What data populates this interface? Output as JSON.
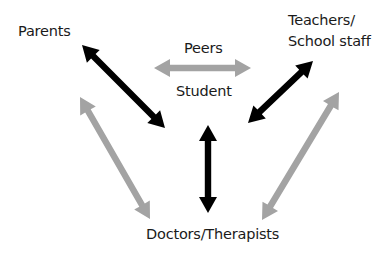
{
  "diagram": {
    "nodes": {
      "parents": "Parents",
      "peers": "Peers",
      "student": "Student",
      "teachers_line1": "Teachers/",
      "teachers_line2": "School staff",
      "doctors": "Doctors/Therapists"
    },
    "colors": {
      "primary_arrow": "#000000",
      "secondary_arrow": "#a3a3a3",
      "text": "#1a1a1a",
      "background": "#ffffff"
    },
    "edges": [
      {
        "from": "Parents",
        "to": "Student",
        "style": "primary",
        "direction": "bidirectional"
      },
      {
        "from": "Student",
        "to": "Peers",
        "style": "secondary",
        "direction": "bidirectional"
      },
      {
        "from": "Teachers/School staff",
        "to": "Student",
        "style": "primary",
        "direction": "bidirectional"
      },
      {
        "from": "Student",
        "to": "Doctors/Therapists",
        "style": "primary",
        "direction": "bidirectional"
      },
      {
        "from": "Parents",
        "to": "Doctors/Therapists",
        "style": "secondary",
        "direction": "bidirectional"
      },
      {
        "from": "Teachers/School staff",
        "to": "Doctors/Therapists",
        "style": "secondary",
        "direction": "bidirectional"
      }
    ]
  }
}
